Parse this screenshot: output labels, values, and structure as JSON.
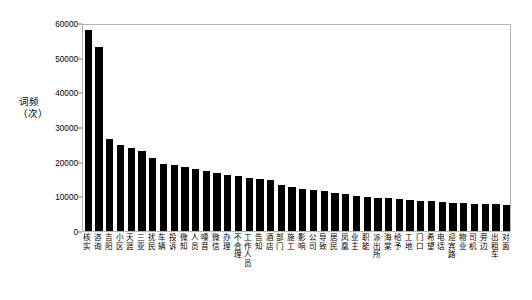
{
  "chart_data": {
    "type": "bar",
    "title": "",
    "xlabel": "",
    "ylabel": "词频\n（次）",
    "ylim": [
      0,
      60000
    ],
    "yticks": [
      0,
      10000,
      20000,
      30000,
      40000,
      50000,
      60000
    ],
    "ytick_labels": [
      "0",
      "10000",
      "20000",
      "30000",
      "40000",
      "50000",
      "60000"
    ],
    "grid": false,
    "legend": false,
    "bar_color": "#000000",
    "categories": [
      "核实",
      "咨询",
      "吉阳",
      "小区",
      "天涯",
      "三亚",
      "扰民",
      "车辆",
      "投诉",
      "微知",
      "人员",
      "噪音",
      "微信",
      "办理",
      "不合理",
      "工作人员",
      "告知",
      "酒店",
      "部门",
      "施工",
      "影响",
      "公司",
      "导致",
      "居民",
      "凤凰",
      "业主",
      "职能",
      "派出所",
      "海棠",
      "给予",
      "工地",
      "门口",
      "希望",
      "电话",
      "迎宾路",
      "物业",
      "司机",
      "旁边",
      "出租车",
      "对面"
    ],
    "values": [
      58000,
      53200,
      26600,
      24800,
      24000,
      23000,
      21000,
      19400,
      18900,
      18400,
      17800,
      17200,
      16800,
      16300,
      15800,
      15400,
      15000,
      14600,
      13200,
      12600,
      12200,
      11800,
      11400,
      11000,
      10600,
      10200,
      9900,
      9600,
      9400,
      9200,
      9000,
      8800,
      8600,
      8400,
      8200,
      8100,
      7900,
      7800,
      7700,
      7600
    ]
  },
  "axis": {
    "y_title": "词频\n（次）"
  }
}
